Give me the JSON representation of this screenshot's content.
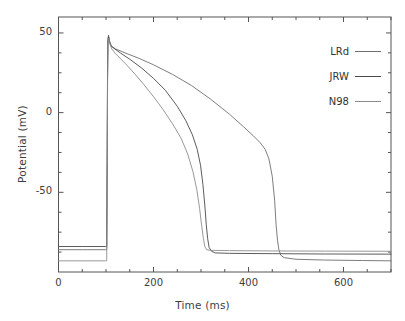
{
  "chart_data": {
    "type": "line",
    "title": "",
    "xlabel": "Time (ms)",
    "ylabel": "Potential (mV)",
    "xlim": [
      0,
      700
    ],
    "ylim": [
      -100,
      60
    ],
    "xticks": [
      0,
      200,
      400,
      600
    ],
    "xtick_labels": [
      "0",
      "200",
      "400",
      "600"
    ],
    "x_minor_ticks": [
      100,
      300,
      500,
      700
    ],
    "yticks": [
      50,
      0,
      -50
    ],
    "ytick_labels": [
      "50",
      "0",
      "-50"
    ],
    "y_minor_ticks": [
      25,
      -25,
      -75
    ],
    "grid": false,
    "legend_position": "upper right",
    "frame": true,
    "tick_direction": "in",
    "series": [
      {
        "name": "LRd",
        "color": "#6e6e6e",
        "resting_potential": -86,
        "peak_potential": 48,
        "upstroke_time": 103,
        "repolarization_time": 460,
        "apd90": 357,
        "points": [
          [
            0,
            -86
          ],
          [
            50,
            -86
          ],
          [
            99,
            -86
          ],
          [
            101.5,
            -86
          ],
          [
            102.5,
            -30
          ],
          [
            103.2,
            20
          ],
          [
            104,
            44
          ],
          [
            105.5,
            47.5
          ],
          [
            108,
            44.5
          ],
          [
            112,
            41.5
          ],
          [
            120,
            40
          ],
          [
            140,
            37.5
          ],
          [
            170,
            34
          ],
          [
            200,
            30
          ],
          [
            240,
            24
          ],
          [
            280,
            17
          ],
          [
            320,
            8.5
          ],
          [
            360,
            -1
          ],
          [
            390,
            -9
          ],
          [
            410,
            -14.5
          ],
          [
            425,
            -19
          ],
          [
            435,
            -23
          ],
          [
            443,
            -29
          ],
          [
            450,
            -40
          ],
          [
            455,
            -55
          ],
          [
            458,
            -70
          ],
          [
            461,
            -80
          ],
          [
            464,
            -86
          ],
          [
            468,
            -89.5
          ],
          [
            475,
            -91
          ],
          [
            500,
            -92
          ],
          [
            560,
            -92.5
          ],
          [
            640,
            -92.8
          ],
          [
            700,
            -93
          ]
        ]
      },
      {
        "name": "JRW",
        "color": "#4a4a4a",
        "resting_potential": -84,
        "peak_potential": 48.5,
        "upstroke_time": 103,
        "repolarization_time": 312,
        "apd90": 209,
        "points": [
          [
            0,
            -84
          ],
          [
            50,
            -84
          ],
          [
            99,
            -84
          ],
          [
            101.5,
            -84
          ],
          [
            102.5,
            -26
          ],
          [
            103.2,
            24
          ],
          [
            104,
            46
          ],
          [
            105.3,
            48.5
          ],
          [
            107,
            45
          ],
          [
            110,
            42
          ],
          [
            116,
            40.5
          ],
          [
            130,
            37.5
          ],
          [
            150,
            33.5
          ],
          [
            175,
            28
          ],
          [
            200,
            21.5
          ],
          [
            225,
            14
          ],
          [
            250,
            4
          ],
          [
            268,
            -5
          ],
          [
            282,
            -14
          ],
          [
            292,
            -23
          ],
          [
            299,
            -33
          ],
          [
            304,
            -45
          ],
          [
            308,
            -58
          ],
          [
            311,
            -70
          ],
          [
            314,
            -79
          ],
          [
            317,
            -84.5
          ],
          [
            322,
            -87
          ],
          [
            330,
            -88
          ],
          [
            360,
            -88.3
          ],
          [
            450,
            -88.5
          ],
          [
            560,
            -88.7
          ],
          [
            700,
            -88.8
          ]
        ]
      },
      {
        "name": "N98",
        "color": "#8c8c8c",
        "resting_potential": -93,
        "peak_potential": 47,
        "upstroke_time": 103,
        "repolarization_time": 305,
        "apd90": 202,
        "points": [
          [
            0,
            -93
          ],
          [
            50,
            -93
          ],
          [
            99,
            -93
          ],
          [
            101.5,
            -93
          ],
          [
            102.5,
            -34
          ],
          [
            103.3,
            18
          ],
          [
            104.2,
            42
          ],
          [
            106,
            46.5
          ],
          [
            108,
            43.5
          ],
          [
            112,
            40
          ],
          [
            120,
            37
          ],
          [
            140,
            31
          ],
          [
            160,
            24.5
          ],
          [
            180,
            17.5
          ],
          [
            200,
            10
          ],
          [
            220,
            2
          ],
          [
            240,
            -7
          ],
          [
            258,
            -16
          ],
          [
            272,
            -26
          ],
          [
            283,
            -37
          ],
          [
            291,
            -48
          ],
          [
            297,
            -60
          ],
          [
            301,
            -70
          ],
          [
            305,
            -79
          ],
          [
            308,
            -84
          ],
          [
            312,
            -86
          ],
          [
            320,
            -86.4
          ],
          [
            360,
            -86.6
          ],
          [
            450,
            -86.8
          ],
          [
            560,
            -86.9
          ],
          [
            700,
            -87
          ]
        ]
      }
    ]
  },
  "legend": {
    "entries": [
      {
        "label": "LRd",
        "color": "#6e6e6e"
      },
      {
        "label": "JRW",
        "color": "#4a4a4a"
      },
      {
        "label": "N98",
        "color": "#8c8c8c"
      }
    ]
  },
  "axes": {
    "frame_color": "#555555",
    "text_color": "#3d3d3d"
  }
}
